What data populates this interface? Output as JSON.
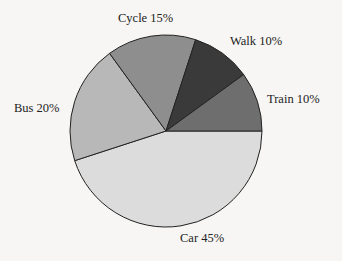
{
  "chart_data": {
    "type": "pie",
    "title": "",
    "categories": [
      "Car",
      "Bus",
      "Cycle",
      "Walk",
      "Train"
    ],
    "values": [
      45,
      20,
      15,
      10,
      10
    ],
    "unit": "%",
    "start_angle_deg": 0,
    "direction": "clockwise",
    "colors": [
      "#dcdcdc",
      "#b8b8b8",
      "#8e8e8e",
      "#3a3a3a",
      "#6e6e6e"
    ],
    "labels": [
      "Car 45%",
      "Bus 20%",
      "Cycle 15%",
      "Walk 10%",
      "Train 10%"
    ],
    "legend": "none (slice labels)"
  },
  "labels": {
    "car": "Car  45%",
    "bus": "Bus 20%",
    "cycle": "Cycle  15%",
    "walk": "Walk  10%",
    "train": "Train  10%"
  }
}
